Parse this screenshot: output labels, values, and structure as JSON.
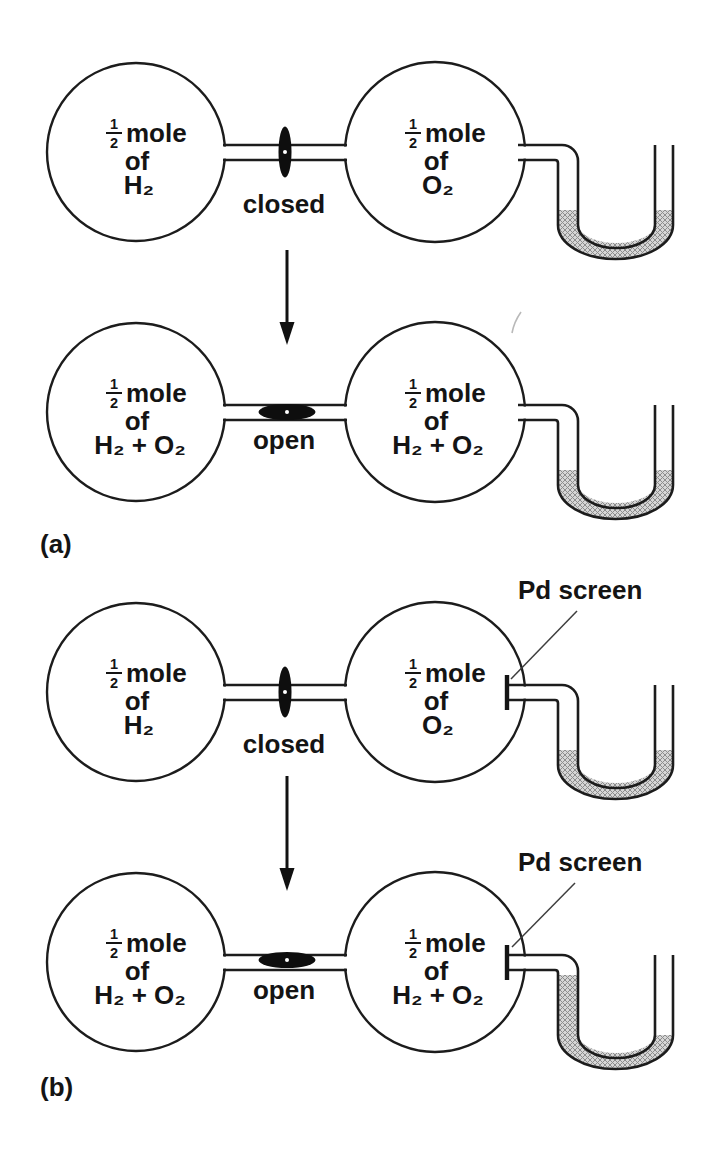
{
  "figure": {
    "fraction": {
      "num": "1",
      "den": "2"
    },
    "unit_label": "mole",
    "of_label": "of",
    "pd_screen_label": "Pd screen",
    "captions": {
      "a": "(a)",
      "b": "(b)"
    },
    "panels": [
      {
        "name": "a-initial",
        "valve": "closed",
        "left_formula": "H₂",
        "right_formula": "O₂",
        "manometer": "liquid levels equal"
      },
      {
        "name": "a-final",
        "valve": "open",
        "left_formula": "H₂ + O₂",
        "right_formula": "H₂ + O₂",
        "manometer": "liquid levels equal"
      },
      {
        "name": "b-initial",
        "valve": "closed",
        "left_formula": "H₂",
        "right_formula": "O₂",
        "manometer": "liquid levels equal"
      },
      {
        "name": "b-final",
        "valve": "open",
        "left_formula": "H₂ + O₂",
        "right_formula": "H₂ + O₂",
        "manometer": "left arm raised, right arm lowered"
      }
    ]
  }
}
